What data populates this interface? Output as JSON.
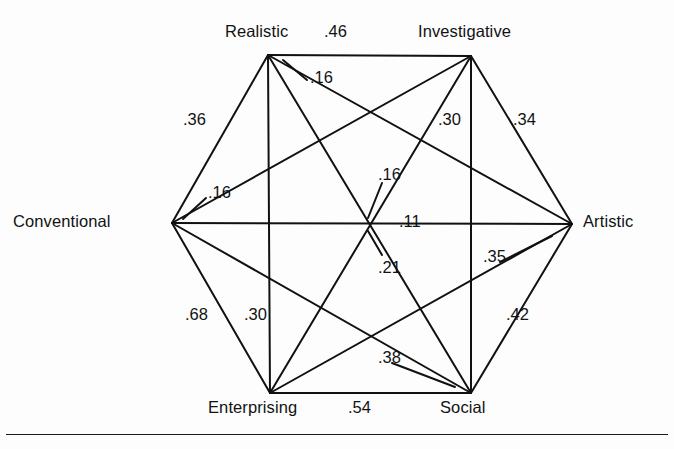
{
  "figure": {
    "line_color": "#111111",
    "background_color": "#fdfdfd",
    "footer_rule": true
  },
  "nodes": [
    {
      "id": "realistic",
      "label": "Realistic",
      "x": 268,
      "y": 55,
      "label_x": 225,
      "label_y": 22,
      "anchor": "start"
    },
    {
      "id": "investigative",
      "label": "Investigative",
      "x": 471,
      "y": 56,
      "label_x": 418,
      "label_y": 22,
      "anchor": "start"
    },
    {
      "id": "artistic",
      "label": "Artistic",
      "x": 572,
      "y": 224,
      "label_x": 583,
      "label_y": 212,
      "anchor": "start"
    },
    {
      "id": "social",
      "label": "Social",
      "x": 471,
      "y": 393,
      "label_x": 440,
      "label_y": 398,
      "anchor": "start"
    },
    {
      "id": "enterprising",
      "label": "Enterprising",
      "x": 270,
      "y": 393,
      "label_x": 208,
      "label_y": 398,
      "anchor": "start"
    },
    {
      "id": "conventional",
      "label": "Conventional",
      "x": 172,
      "y": 223,
      "label_x": 13,
      "label_y": 212,
      "anchor": "start"
    }
  ],
  "edges": [
    {
      "id": "realistic-investigative",
      "from": "realistic",
      "to": "investigative",
      "value": ".46",
      "label_x": 324,
      "label_y": 22,
      "leader": null
    },
    {
      "id": "investigative-artistic",
      "from": "investigative",
      "to": "artistic",
      "value": ".34",
      "label_x": 513,
      "label_y": 110,
      "leader": null
    },
    {
      "id": "artistic-social",
      "from": "artistic",
      "to": "social",
      "value": ".42",
      "label_x": 506,
      "label_y": 305,
      "leader": null
    },
    {
      "id": "social-enterprising",
      "from": "social",
      "to": "enterprising",
      "value": ".54",
      "label_x": 348,
      "label_y": 398,
      "leader": null
    },
    {
      "id": "enterprising-conventional",
      "from": "enterprising",
      "to": "conventional",
      "value": ".68",
      "label_x": 185,
      "label_y": 305,
      "leader": null
    },
    {
      "id": "conventional-realistic",
      "from": "conventional",
      "to": "realistic",
      "value": ".36",
      "label_x": 183,
      "label_y": 110,
      "leader": null
    },
    {
      "id": "realistic-enterprising",
      "from": "realistic",
      "to": "enterprising",
      "value": ".30",
      "label_x": 244,
      "label_y": 305,
      "leader": null
    },
    {
      "id": "investigative-social",
      "from": "investigative",
      "to": "social",
      "value": ".30",
      "label_x": 438,
      "label_y": 110,
      "leader": null
    },
    {
      "id": "conventional-artistic",
      "from": "conventional",
      "to": "artistic",
      "value": ".11",
      "label_x": 399,
      "label_y": 212,
      "leader": null
    },
    {
      "id": "realistic-artistic",
      "from": "realistic",
      "to": "artistic",
      "value": ".16",
      "label_x": 310,
      "label_y": 68,
      "leader": {
        "x1": 307,
        "y1": 80,
        "x2": 283,
        "y2": 60
      }
    },
    {
      "id": "conventional-investigative",
      "from": "conventional",
      "to": "investigative",
      "value": ".16",
      "label_x": 208,
      "label_y": 183,
      "leader": {
        "x1": 206,
        "y1": 198,
        "x2": 183,
        "y2": 219
      }
    },
    {
      "id": "realistic-social",
      "from": "realistic",
      "to": "social",
      "value": ".16",
      "label_x": 378,
      "label_y": 165,
      "leader": {
        "x1": 382,
        "y1": 183,
        "x2": 368,
        "y2": 218
      }
    },
    {
      "id": "investigative-enterprising",
      "from": "investigative",
      "to": "enterprising",
      "value": ".21",
      "label_x": 378,
      "label_y": 258,
      "leader": {
        "x1": 382,
        "y1": 255,
        "x2": 368,
        "y2": 231
      }
    },
    {
      "id": "artistic-enterprising",
      "from": "artistic",
      "to": "enterprising",
      "value": ".35",
      "label_x": 483,
      "label_y": 247,
      "leader": {
        "x1": 500,
        "y1": 262,
        "x2": 552,
        "y2": 236
      }
    },
    {
      "id": "conventional-social",
      "from": "conventional",
      "to": "social",
      "value": ".38",
      "label_x": 378,
      "label_y": 348,
      "leader": {
        "x1": 392,
        "y1": 363,
        "x2": 455,
        "y2": 387
      }
    }
  ],
  "chart_data": {
    "type": "diagram",
    "node_order": [
      "Realistic",
      "Investigative",
      "Artistic",
      "Social",
      "Enterprising",
      "Conventional"
    ],
    "matrix_pairs": [
      {
        "pair": [
          "Realistic",
          "Investigative"
        ],
        "value": 0.46
      },
      {
        "pair": [
          "Realistic",
          "Artistic"
        ],
        "value": 0.16
      },
      {
        "pair": [
          "Realistic",
          "Social"
        ],
        "value": 0.16
      },
      {
        "pair": [
          "Realistic",
          "Enterprising"
        ],
        "value": 0.3
      },
      {
        "pair": [
          "Realistic",
          "Conventional"
        ],
        "value": 0.36
      },
      {
        "pair": [
          "Investigative",
          "Artistic"
        ],
        "value": 0.34
      },
      {
        "pair": [
          "Investigative",
          "Social"
        ],
        "value": 0.3
      },
      {
        "pair": [
          "Investigative",
          "Enterprising"
        ],
        "value": 0.21
      },
      {
        "pair": [
          "Investigative",
          "Conventional"
        ],
        "value": 0.16
      },
      {
        "pair": [
          "Artistic",
          "Social"
        ],
        "value": 0.42
      },
      {
        "pair": [
          "Artistic",
          "Enterprising"
        ],
        "value": 0.35
      },
      {
        "pair": [
          "Artistic",
          "Conventional"
        ],
        "value": 0.11
      },
      {
        "pair": [
          "Social",
          "Enterprising"
        ],
        "value": 0.54
      },
      {
        "pair": [
          "Social",
          "Conventional"
        ],
        "value": 0.38
      },
      {
        "pair": [
          "Enterprising",
          "Conventional"
        ],
        "value": 0.68
      }
    ]
  }
}
